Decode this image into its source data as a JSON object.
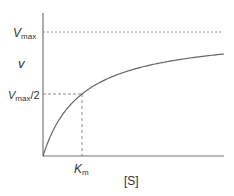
{
  "chart_data": {
    "type": "line",
    "title": "",
    "xlabel": "[S]",
    "ylabel": "v",
    "function": "v = Vmax*[S]/(Km+[S])",
    "series": [
      {
        "name": "Michaelis-Menten curve",
        "x": [
          0,
          0.25,
          0.5,
          1,
          2,
          3,
          4,
          4.64
        ],
        "y": [
          0,
          0.2,
          0.333,
          0.5,
          0.667,
          0.75,
          0.8,
          0.823
        ]
      }
    ],
    "reference_lines": [
      {
        "type": "horizontal",
        "label": "Vmax",
        "value": 1.0,
        "style": "dashed"
      },
      {
        "type": "horizontal",
        "label": "Vmax/2",
        "value": 0.5,
        "style": "dashed"
      },
      {
        "type": "vertical",
        "label": "Km",
        "value": 1.0,
        "style": "dashed"
      }
    ],
    "grid": false,
    "legend": null,
    "units": "Km = 1, Vmax = 1 (schematic)"
  },
  "labels": {
    "vmax_main": "V",
    "vmax_sub": "max",
    "v_axis": "v",
    "half_main": "V",
    "half_sub": "max",
    "half_suffix": "/2",
    "km_main": "K",
    "km_sub": "m",
    "x_axis": "[S]"
  },
  "colors": {
    "axis": "#777777",
    "curve": "#666666",
    "dashed": "#888888",
    "text": "#333333"
  }
}
